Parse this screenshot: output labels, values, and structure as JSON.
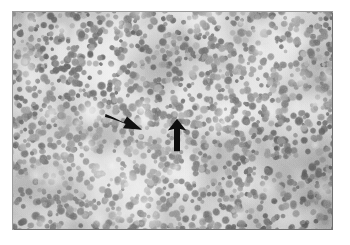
{
  "figure": {
    "kind": "histopathology-micrograph",
    "modality": "light-microscopy",
    "stain_appearance": "grayscale",
    "caption": "",
    "plate": {
      "left": 13,
      "top": 12,
      "width": 319,
      "height": 217,
      "border_color": "#6f6f6f",
      "page_background": "#ffffff"
    },
    "tissue": {
      "description": "densely packed small round dark nuclei on a pale background",
      "background_color": "#d8d8d8",
      "nucleus_color_dark": "#6b6b6b",
      "nucleus_color_mid": "#8e8e8e",
      "nucleus_color_light": "#a8a8a8",
      "highlight_color": "#f2f2f2",
      "nucleus_count": 1750,
      "nucleus_radius_min": 2.1,
      "nucleus_radius_max": 4.6
    },
    "annotations": [
      {
        "name": "arrow-right",
        "icon": "arrow-icon",
        "label": "",
        "direction": "right-down",
        "color": "#111111",
        "tip_x": 128,
        "tip_y": 126,
        "tail_x": 105,
        "tail_y": 114
      },
      {
        "name": "arrow-up",
        "icon": "arrow-icon",
        "label": "",
        "direction": "up",
        "color": "#0d0d0d",
        "tip_x": 175,
        "tip_y": 121,
        "tail_x": 175,
        "tail_y": 148
      }
    ]
  }
}
